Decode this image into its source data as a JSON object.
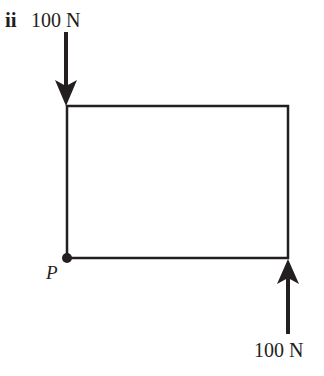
{
  "part_label": "ii",
  "forces": [
    {
      "id": "top",
      "label": "100 N",
      "direction": "down",
      "applied_at": "top-left corner"
    },
    {
      "id": "bottom",
      "label": "100 N",
      "direction": "up",
      "applied_at": "bottom-right corner"
    }
  ],
  "point": {
    "label": "P",
    "location": "bottom-left corner"
  },
  "shape": {
    "type": "rectangle",
    "color": "#231f20"
  }
}
